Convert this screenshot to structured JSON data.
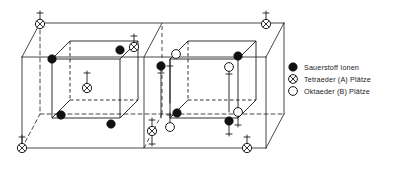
{
  "legend": {
    "items": [
      {
        "marker": "filled-circle-icon",
        "label": "Sauerstoff  Ionen",
        "color": "#000000"
      },
      {
        "marker": "crossed-circle-icon",
        "label": "Tetraeder (A) Plätze",
        "color": "#000000"
      },
      {
        "marker": "open-circle-icon",
        "label": "Oktaeder (B) Plätze",
        "color": "#000000"
      }
    ]
  },
  "colors": {
    "line": "#1a1a1a",
    "fill_dark": "#111111",
    "fill_light": "#ffffff",
    "background": "#ffffff"
  },
  "structure": {
    "outer_box": {
      "name": "outer-unit-cell",
      "front_bottom_left": [
        22,
        148
      ],
      "front_bottom_right": [
        266,
        148
      ],
      "front_top_left": [
        22,
        57
      ],
      "front_top_right": [
        266,
        57
      ],
      "back_offset": [
        18,
        -34
      ]
    },
    "divider_x": 144,
    "left_octant": {
      "name": "left-octant-tetrahedral",
      "front_bottom_left": [
        48,
        128
      ],
      "front_top_right": [
        124,
        54
      ],
      "depth": [
        18,
        -18
      ]
    },
    "right_octant": {
      "name": "right-octant-octahedral",
      "front_bottom_left": [
        170,
        128
      ],
      "front_top_right": [
        246,
        54
      ],
      "depth": [
        18,
        -18
      ]
    },
    "oxygen_ions": {
      "count": 8,
      "left": [
        [
          52,
          59
        ],
        [
          120,
          50
        ],
        [
          70,
          41
        ],
        [
          103,
          32
        ]
      ],
      "right": [
        [
          166,
          57
        ],
        [
          236,
          50
        ],
        [
          190,
          42
        ],
        [
          222,
          33
        ]
      ]
    },
    "tetrahedral_sites": {
      "count": 6,
      "corners": [
        "top-left",
        "top-mid",
        "top-right",
        "bottom-left",
        "bottom-mid",
        "bottom-right"
      ],
      "center_left_octant": true
    },
    "octahedral_sites": {
      "count": 4,
      "positions": [
        "upper-left",
        "upper-right",
        "lower-left",
        "lower-right"
      ]
    },
    "spin_arrows": {
      "up": 9,
      "down": 7
    }
  }
}
